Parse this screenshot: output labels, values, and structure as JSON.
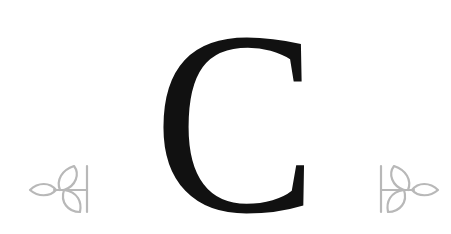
{
  "logo": {
    "letter": "C",
    "letter_color": "#111111",
    "ornament_color": "#b8b8b8",
    "background": "#ffffff",
    "ornaments": [
      {
        "side": "left",
        "icon": "leaf-sprig-icon",
        "orientation": "leaves-pointing-left"
      },
      {
        "side": "right",
        "icon": "leaf-sprig-icon",
        "orientation": "leaves-pointing-right"
      }
    ]
  }
}
